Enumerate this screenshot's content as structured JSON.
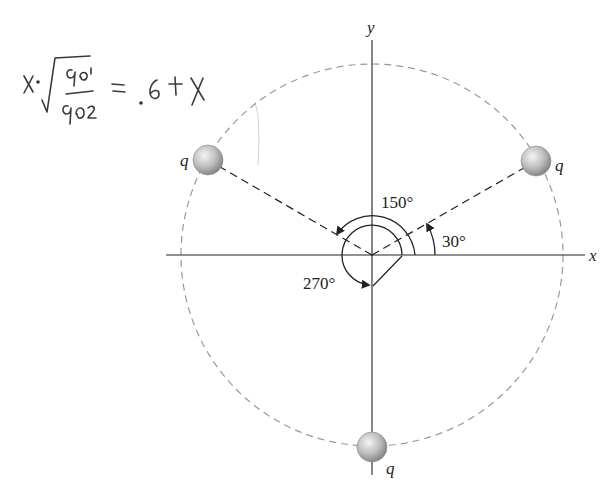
{
  "figure": {
    "axes": {
      "x_label": "x",
      "y_label": "y"
    },
    "charges": [
      {
        "name": "charge-upper-left",
        "label": "q",
        "angle_deg": 150
      },
      {
        "name": "charge-upper-right",
        "label": "q",
        "angle_deg": 30
      },
      {
        "name": "charge-bottom",
        "label": "q",
        "angle_deg": 270
      }
    ],
    "angles": [
      {
        "label": "30°",
        "value_deg": 30
      },
      {
        "label": "150°",
        "value_deg": 150
      },
      {
        "label": "270°",
        "value_deg": 270
      }
    ],
    "handwritten_note": {
      "text": "x·√(q1/q2) = .6 + x",
      "lhs": "x·",
      "numerator": "q1",
      "denominator": "q2",
      "rhs": "= .6 + x"
    },
    "colors": {
      "ink": "#222222",
      "dashed_circle": "#9a9a9a",
      "charge_fill_light": "#e8e8e8",
      "charge_fill_dark": "#8c8c8c"
    }
  }
}
